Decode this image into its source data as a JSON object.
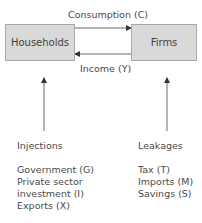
{
  "diagram": {
    "nodes": {
      "households": "Households",
      "firms": "Firms"
    },
    "flows": {
      "consumption": "Consumption  (C)",
      "income": "Income (Y)"
    },
    "injections": {
      "title": "Injections",
      "items": [
        "Government (G)",
        "Private sector",
        "investment  (I)",
        "Exports (X)"
      ]
    },
    "leakages": {
      "title": "Leakages",
      "items": [
        "Tax (T)",
        "Imports (M)",
        "Savings (S)"
      ]
    },
    "colors": {
      "box_fill": "#d9d9d9",
      "box_border": "#a8a8a8",
      "line": "#6a6a6a",
      "arrowhead": "#333333",
      "text": "#4a4a4a"
    }
  }
}
